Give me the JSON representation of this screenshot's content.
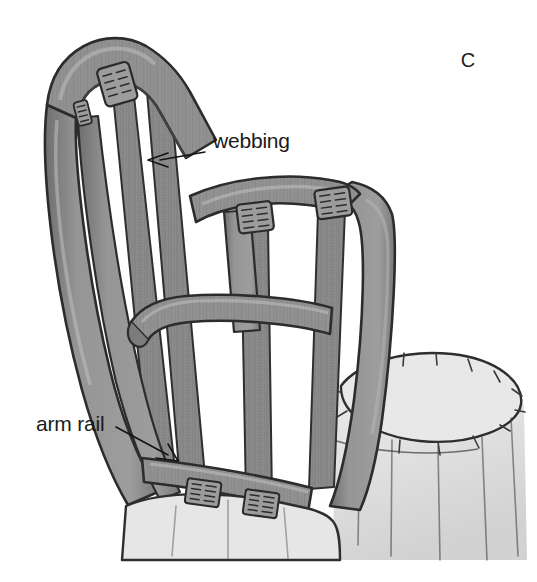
{
  "figure": {
    "panel_letter": "C",
    "background_color": "#ffffff",
    "ink_color": "#2a2a2a",
    "frame_fill": "#8f8f8f",
    "frame_shadow": "#6e6e6e",
    "frame_highlight": "#a8a8a8",
    "webbing_fill": "#8a8a8a",
    "cushion_fill": "#e2e2e2",
    "cushion_shadow": "#cccccc",
    "clip_fill": "#9a9a9a"
  },
  "labels": [
    {
      "id": "webbing",
      "text": "webbing",
      "text_x": 213,
      "text_y": 148,
      "anchor": "start",
      "leader": "M 205 152 L 160 160",
      "arrow": "M 148 160 L 166 154 M 148 160 L 166 166",
      "description": "points to a vertical webbing strap on the chair back"
    },
    {
      "id": "arm-rail",
      "text": "arm rail",
      "text_x": 36,
      "text_y": 431,
      "anchor": "start",
      "leader": "M 118 428 L 168 455",
      "arrow": "M 176 460 L 156 458 M 176 460 L 167 445",
      "description": "points to the horizontal arm rail at the lower left of the frame"
    }
  ],
  "parts": [
    {
      "id": "crest-rail",
      "name": "crest rail"
    },
    {
      "id": "left-back-post",
      "name": "left back post"
    },
    {
      "id": "right-back-post",
      "name": "right back post"
    },
    {
      "id": "arm-rail",
      "name": "arm rail"
    },
    {
      "id": "side-rail",
      "name": "side rail"
    },
    {
      "id": "seat-cushion",
      "name": "seat cushion"
    },
    {
      "id": "webbing-strap",
      "name": "webbing strap"
    },
    {
      "id": "webbing-clip",
      "name": "webbing clip"
    }
  ],
  "webbing_clips": [
    {
      "id": "clip-crest-left",
      "x": 96,
      "y": 70,
      "w": 32,
      "h": 36,
      "rot": -16,
      "rows": 5
    },
    {
      "id": "clip-crest-small",
      "x": 72,
      "y": 100,
      "w": 14,
      "h": 22,
      "rot": -14,
      "rows": 5
    },
    {
      "id": "clip-rail-mid",
      "x": 237,
      "y": 203,
      "w": 34,
      "h": 28,
      "rot": -7,
      "rows": 4
    },
    {
      "id": "clip-rail-right",
      "x": 315,
      "y": 190,
      "w": 34,
      "h": 28,
      "rot": -8,
      "rows": 4
    },
    {
      "id": "clip-bottom-left",
      "x": 190,
      "y": 479,
      "w": 32,
      "h": 24,
      "rot": 8,
      "rows": 4
    },
    {
      "id": "clip-bottom-mid",
      "x": 248,
      "y": 489,
      "w": 32,
      "h": 24,
      "rot": 8,
      "rows": 4
    }
  ]
}
